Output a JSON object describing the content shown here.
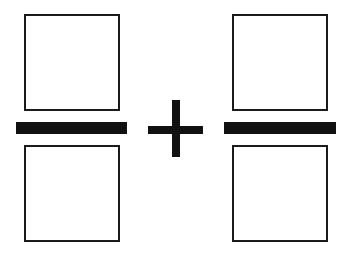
{
  "diagram": {
    "colors": {
      "background": "#ffffff",
      "stroke": "#1a1a1a",
      "fill_bar": "#111111"
    },
    "left_fraction": {
      "numerator": {
        "shape": "empty-square",
        "x": 24,
        "y": 14,
        "w": 96,
        "h": 97
      },
      "bar": {
        "x": 16,
        "y": 122,
        "w": 111,
        "h": 12
      },
      "denominator": {
        "shape": "empty-square",
        "x": 24,
        "y": 145,
        "w": 96,
        "h": 97
      }
    },
    "operator": {
      "symbol": "+",
      "vertical": {
        "x": 172,
        "y": 100,
        "w": 8,
        "h": 57
      },
      "horizontal": {
        "x": 148,
        "y": 126,
        "w": 55,
        "h": 8
      }
    },
    "right_fraction": {
      "numerator": {
        "shape": "empty-square",
        "x": 232,
        "y": 14,
        "w": 96,
        "h": 97
      },
      "bar": {
        "x": 224,
        "y": 122,
        "w": 112,
        "h": 12
      },
      "denominator": {
        "shape": "empty-square",
        "x": 232,
        "y": 145,
        "w": 96,
        "h": 97
      }
    }
  }
}
